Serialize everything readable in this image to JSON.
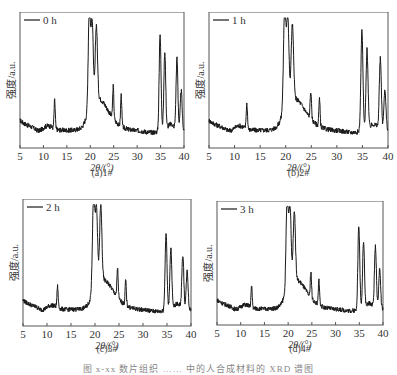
{
  "figure_caption": "图 x-xx  数片组织 ……  中的人合成材料的 XRD 谱图",
  "chart_data": [
    {
      "type": "line",
      "panel": "a",
      "caption": "(a)1#",
      "legend": "0 h",
      "xlabel": "2θ/(°)",
      "ylabel": "强度/a.u.",
      "xlim": [
        5,
        40
      ],
      "xticks": [
        5,
        10,
        15,
        20,
        25,
        30,
        35,
        40
      ],
      "grid": false,
      "peaks_2theta": [
        12.4,
        19.8,
        20.4,
        21.3,
        24.9,
        26.6,
        34.9,
        35.9,
        38.5,
        39.4
      ],
      "peaks_rel_intensity": [
        0.25,
        1.0,
        0.85,
        0.78,
        0.3,
        0.28,
        0.85,
        0.68,
        0.62,
        0.35
      ],
      "baseline_rel": 0.14
    },
    {
      "type": "line",
      "panel": "b",
      "caption": "(b)2#",
      "legend": "1 h",
      "xlabel": "2θ/(°)",
      "ylabel": "强度/a.u.",
      "xlim": [
        5,
        40
      ],
      "xticks": [
        5,
        10,
        15,
        20,
        25,
        30,
        35,
        40
      ],
      "grid": false,
      "peaks_2theta": [
        12.4,
        19.8,
        20.4,
        21.3,
        24.9,
        26.6,
        34.9,
        35.9,
        38.5,
        39.4
      ],
      "peaks_rel_intensity": [
        0.22,
        1.0,
        0.88,
        0.78,
        0.26,
        0.24,
        0.88,
        0.7,
        0.62,
        0.36
      ],
      "baseline_rel": 0.14
    },
    {
      "type": "line",
      "panel": "c",
      "caption": "(c)3#",
      "legend": "2 h",
      "xlabel": "2θ/(°)",
      "ylabel": "强度/a.u.",
      "xlim": [
        5,
        40
      ],
      "xticks": [
        5,
        10,
        15,
        20,
        25,
        30,
        35,
        40
      ],
      "grid": false,
      "peaks_2theta": [
        12.2,
        19.7,
        20.3,
        21.2,
        24.7,
        26.4,
        34.8,
        35.8,
        38.3,
        39.2
      ],
      "peaks_rel_intensity": [
        0.2,
        1.0,
        0.85,
        0.85,
        0.3,
        0.24,
        0.72,
        0.58,
        0.5,
        0.36
      ],
      "baseline_rel": 0.14
    },
    {
      "type": "line",
      "panel": "d",
      "caption": "(d)4#",
      "legend": "3 h",
      "xlabel": "2θ/(°)",
      "ylabel": "强度/a.u.",
      "xlim": [
        5,
        40
      ],
      "xticks": [
        5,
        10,
        15,
        20,
        25,
        30,
        35,
        40
      ],
      "grid": false,
      "peaks_2theta": [
        12.3,
        19.8,
        20.4,
        21.3,
        24.8,
        26.5,
        34.9,
        35.9,
        38.4,
        39.3
      ],
      "peaks_rel_intensity": [
        0.2,
        1.0,
        0.88,
        0.8,
        0.27,
        0.25,
        0.8,
        0.65,
        0.6,
        0.38
      ],
      "baseline_rel": 0.14
    }
  ],
  "layout": {
    "panels": [
      {
        "left": 20,
        "top": 12,
        "width": 164,
        "height": 136,
        "caption_top": 167
      },
      {
        "left": 209,
        "top": 12,
        "width": 179,
        "height": 136,
        "caption_top": 167
      },
      {
        "left": 23,
        "top": 199,
        "width": 168,
        "height": 127,
        "caption_top": 343
      },
      {
        "left": 217,
        "top": 201,
        "width": 166,
        "height": 124,
        "caption_top": 343
      }
    ],
    "line_color": "#1a1a1a",
    "axis_color": "#555555"
  }
}
